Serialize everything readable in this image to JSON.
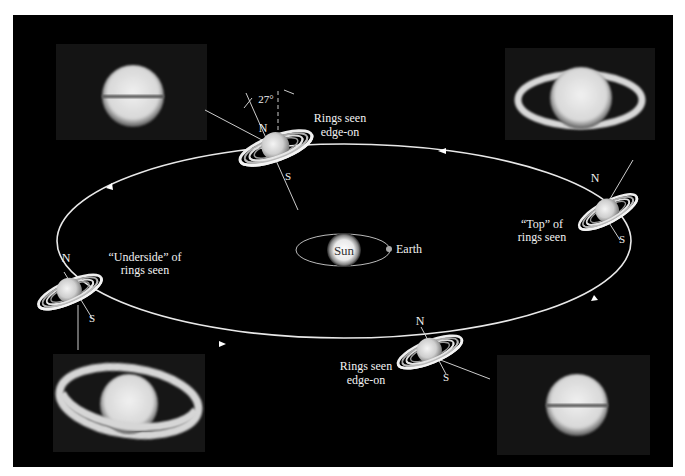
{
  "diagram": {
    "background": "#000000",
    "orbit_color": "#e8e8e8",
    "center": {
      "sun_label": "Sun",
      "earth_label": "Earth"
    },
    "saturn_positions": [
      {
        "id": "top",
        "labels": [
          "Rings seen",
          "edge-on"
        ],
        "north": "N",
        "south": "S",
        "tilt_label": "27°"
      },
      {
        "id": "right",
        "labels": [
          "“Top” of",
          "rings seen"
        ],
        "north": "N",
        "south": "S"
      },
      {
        "id": "bottom",
        "labels": [
          "Rings seen",
          "edge-on"
        ],
        "north": "N",
        "south": "S"
      },
      {
        "id": "left",
        "labels": [
          "“Underside” of",
          "rings seen"
        ],
        "north": "N",
        "south": "S"
      }
    ],
    "photos": [
      {
        "id": "top-left",
        "view": "edge-on"
      },
      {
        "id": "top-right",
        "view": "top of rings"
      },
      {
        "id": "bottom-left",
        "view": "underside of rings"
      },
      {
        "id": "bottom-right",
        "view": "edge-on"
      }
    ]
  }
}
